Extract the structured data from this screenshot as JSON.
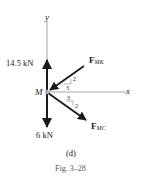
{
  "diagram": {
    "type": "free-body-diagram",
    "origin_label": "M",
    "axes": {
      "x_label": "x",
      "y_label": "y"
    },
    "forces": [
      {
        "id": "up",
        "magnitude_label": "14.5 kN",
        "direction": "up"
      },
      {
        "id": "down",
        "magnitude_label": "6 kN",
        "direction": "down"
      },
      {
        "id": "f_mk",
        "symbol": "F",
        "subscript": "MK",
        "direction": "toward M from upper-right",
        "slope": {
          "rise": "2",
          "run": "3"
        }
      },
      {
        "id": "f_mc",
        "symbol": "F",
        "subscript": "MC",
        "direction": "away from M toward lower-right",
        "slope": {
          "rise": "2",
          "run": "3"
        }
      }
    ],
    "part_label": "(d)",
    "figure_caption": "Fig. 3–28"
  },
  "colors": {
    "ink": "#1a1a1a",
    "axis": "#8c8c8c",
    "origin_dot": "#b0b0b0"
  }
}
